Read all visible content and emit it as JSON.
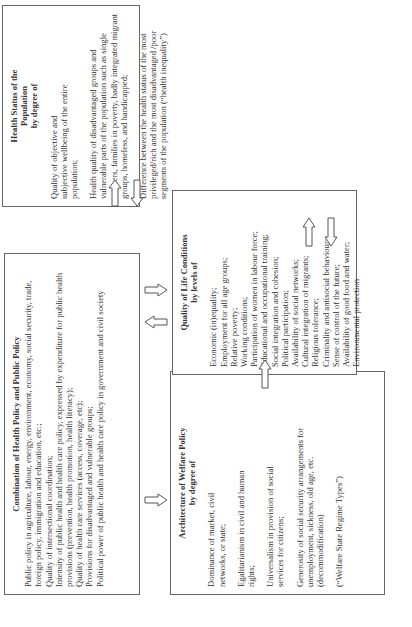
{
  "diagram": {
    "architecture": {
      "title_line1": "Architecture of Welfare Policy",
      "title_line2": "by degree of",
      "items": [
        "Dominance of market, civil networks, or state;",
        "Egalitarianism in civil and human rights;",
        "Universalism in provision of social services for citizens;",
        "Generosity of social security arrangements for unemployment, sickness, old age, etc. (decommodification)",
        "(“Welfare State Regime Types”)"
      ]
    },
    "quality_of_life": {
      "title_line1": "Quality of Life Conditions",
      "title_line2": "by levels of",
      "items": [
        "Economic (in)equality;",
        "Employment for all age groups;",
        "Relative poverty;",
        "Working conditions;",
        "Participation of women in labour force;",
        "Educational and occupational training;",
        "Social integration and cohesion;",
        "Political participation;",
        "Availability of social networks;",
        "Cultural integration of migrants;",
        "Religious tolerance;",
        "Criminality and antisocial behaviour;",
        "Sense of control of the future;",
        "Availability of good food and water;",
        "Environmental protection"
      ]
    },
    "health_status": {
      "title_line1": "Health Status of the",
      "title_line2": "Population",
      "title_line3": "by degree of",
      "items": [
        "Quality of objective and subjective wellbeing of the entire population;",
        "Health quality of disadvantaged groups and vulnerable parts of the population such as single mothers, families in poverty, badly integrated migrant groups, homeless, and handicapped;",
        "Difference between the health status of the most privileged/rich and the most disadvantaged /poor segments of the population (“health inequality”)"
      ]
    },
    "combination": {
      "title": "Combination of Health Policy and Public Policy",
      "items": [
        "Public policy in agriculture, labour, energy, environment, economy, social security, trade, foreign policy, immigration and education, etc.;",
        "Quality of intersectional coordination;",
        "Intensity of public health and health care policy, expressed by expenditure for public health provisions (prevention, health promotion, health literacy);",
        "Quality of health care services (access, coverage, etc);",
        "Provisions for disadvantaged and vulnerable groups;",
        "Political power of public health and health care policy in government and civil society"
      ]
    },
    "colors": {
      "border": "#666666",
      "text": "#333333",
      "background": "#ffffff"
    }
  }
}
